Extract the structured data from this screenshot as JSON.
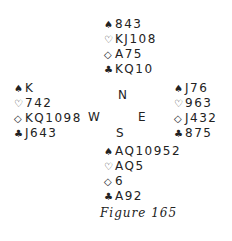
{
  "hands": {
    "north": {
      "spades": {
        "symbol": "♠",
        "cards": "843"
      },
      "hearts": {
        "symbol": "♡",
        "cards": "KJ108"
      },
      "diamonds": {
        "symbol": "◇",
        "cards": "A75"
      },
      "clubs": {
        "symbol": "♣",
        "cards": "KQ10"
      }
    },
    "west": {
      "spades": {
        "symbol": "♠",
        "cards": "K"
      },
      "hearts": {
        "symbol": "♡",
        "cards": "742"
      },
      "diamonds": {
        "symbol": "◇",
        "cards": "KQ1098"
      },
      "clubs": {
        "symbol": "♣",
        "cards": "J643"
      }
    },
    "east": {
      "spades": {
        "symbol": "♠",
        "cards": "J76"
      },
      "hearts": {
        "symbol": "♡",
        "cards": "963"
      },
      "diamonds": {
        "symbol": "◇",
        "cards": "J432"
      },
      "clubs": {
        "symbol": "♣",
        "cards": "875"
      }
    },
    "south": {
      "spades": {
        "symbol": "♠",
        "cards": "AQ10952"
      },
      "hearts": {
        "symbol": "♡",
        "cards": "AQ5"
      },
      "diamonds": {
        "symbol": "◇",
        "cards": "6"
      },
      "clubs": {
        "symbol": "♣",
        "cards": "A92"
      }
    }
  },
  "compass": {
    "north": "N",
    "west": "W",
    "east": "E",
    "south": "S"
  },
  "caption": "Figure 165"
}
